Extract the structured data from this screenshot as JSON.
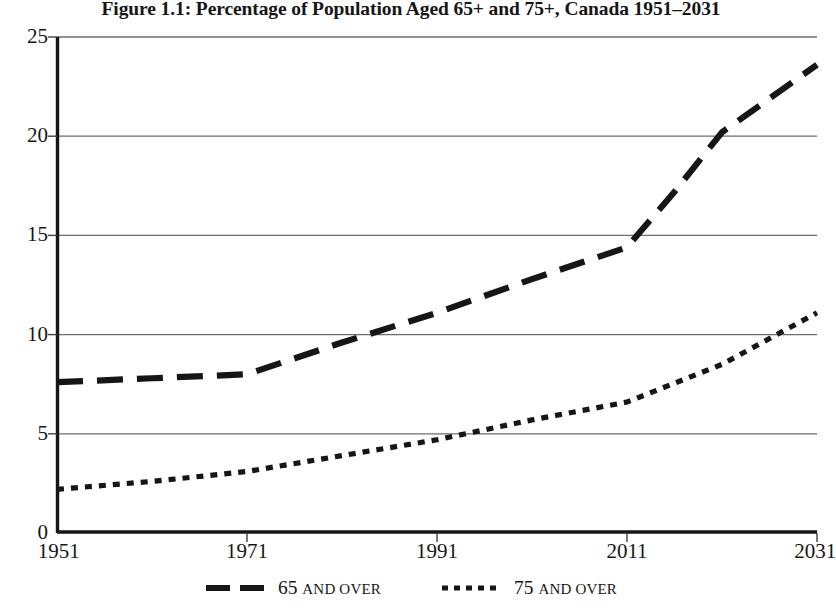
{
  "chart_data": {
    "type": "line",
    "title": "Figure 1.1: Percentage of Population Aged 65+ and 75+, Canada 1951–2031",
    "xlabel": "",
    "ylabel": "",
    "xlim": [
      1951,
      2031
    ],
    "ylim": [
      0,
      25
    ],
    "grid": true,
    "legend_position": "bottom",
    "x_ticks": [
      1951,
      1971,
      1991,
      2011,
      2031
    ],
    "x_tick_labels": [
      "1951",
      "1971",
      "1991",
      "2011",
      "2031"
    ],
    "y_ticks": [
      0,
      5,
      10,
      15,
      20,
      25
    ],
    "y_tick_labels": [
      "0",
      "5",
      "10",
      "15",
      "20",
      "25"
    ],
    "series": [
      {
        "name": "65 and over",
        "legend_label_number": "65",
        "legend_label_text": "and over",
        "style": "dashed",
        "color": "#161616",
        "x": [
          1951,
          1961,
          1971,
          1981,
          1991,
          2001,
          2011,
          2016,
          2021,
          2031
        ],
        "values": [
          7.6,
          7.8,
          8.0,
          9.6,
          11.1,
          12.8,
          14.4,
          17.2,
          20.2,
          23.6
        ]
      },
      {
        "name": "75 and over",
        "legend_label_number": "75",
        "legend_label_text": "and over",
        "style": "dotted",
        "color": "#161616",
        "x": [
          1951,
          1961,
          1971,
          1981,
          1991,
          2001,
          2011,
          2021,
          2031
        ],
        "values": [
          2.2,
          2.6,
          3.1,
          3.9,
          4.7,
          5.7,
          6.6,
          8.5,
          11.1
        ]
      }
    ]
  },
  "axes": {
    "y_labels": [
      {
        "label": "25",
        "value": 25
      },
      {
        "label": "20",
        "value": 20
      },
      {
        "label": "15",
        "value": 15
      },
      {
        "label": "10",
        "value": 10
      },
      {
        "label": "5",
        "value": 5
      },
      {
        "label": "0",
        "value": 0
      }
    ],
    "x_labels": [
      {
        "label": "1951",
        "value": 1951
      },
      {
        "label": "1971",
        "value": 1971
      },
      {
        "label": "1991",
        "value": 1991
      },
      {
        "label": "2011",
        "value": 2011
      },
      {
        "label": "2031",
        "value": 2031
      }
    ]
  },
  "legend": {
    "entries": [
      {
        "number": "65",
        "text": "and over",
        "style": "dashed"
      },
      {
        "number": "75",
        "text": "and over",
        "style": "dotted"
      }
    ]
  }
}
